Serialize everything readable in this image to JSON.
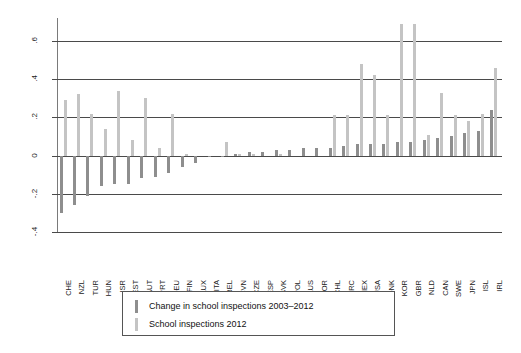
{
  "chart_data": {
    "type": "bar",
    "title": "",
    "subtitle": "",
    "xlabel": "",
    "ylabel": "",
    "ylim": [
      -0.4,
      0.72
    ],
    "yticks": [
      0.6,
      0.4,
      0.2,
      0,
      -0.2,
      -0.4
    ],
    "ytick_labels": [
      ".6",
      ".4",
      ".2",
      "0",
      "-.2",
      "-.4"
    ],
    "grid": true,
    "legend_position": "below-plot",
    "categories": [
      "CHE",
      "NZL",
      "TUR",
      "HUN",
      "ISR",
      "EST",
      "AUT",
      "PRT",
      "DEU",
      "FIN",
      "LUX",
      "ITA",
      "BEL",
      "SVN",
      "CZE",
      "ESP",
      "SVK",
      "POL",
      "AUS",
      "NOR",
      "CHL",
      "GRC",
      "MEX",
      "USA",
      "DNK",
      "KOR",
      "GBR",
      "NLD",
      "CAN",
      "SWE",
      "JPN",
      "ISL",
      "IRL"
    ],
    "series": [
      {
        "name": "Change in school inspections 2003–2012",
        "color": "#8e8e8e",
        "values": [
          -0.3,
          -0.26,
          -0.21,
          -0.16,
          -0.15,
          -0.15,
          -0.12,
          -0.11,
          -0.09,
          -0.06,
          -0.04,
          -0.01,
          0.0,
          0.01,
          0.02,
          0.02,
          0.03,
          0.03,
          0.04,
          0.04,
          0.04,
          0.05,
          0.06,
          0.06,
          0.06,
          0.07,
          0.07,
          0.08,
          0.09,
          0.1,
          0.12,
          0.13,
          0.24
        ]
      },
      {
        "name": "School inspections 2012",
        "color": "#c4c4c4",
        "values": [
          0.29,
          0.32,
          0.22,
          0.14,
          0.34,
          0.08,
          0.3,
          0.04,
          0.22,
          0.01,
          0.0,
          0.0,
          0.07,
          0.01,
          0.01,
          0.0,
          0.01,
          0.0,
          0.0,
          0.0,
          0.21,
          0.21,
          0.48,
          0.42,
          0.21,
          0.69,
          0.69,
          0.11,
          0.33,
          0.21,
          0.18,
          0.22,
          0.46
        ]
      }
    ]
  },
  "legend": {
    "items": [
      {
        "label": "Change in school inspections 2003–2012",
        "color": "#8e8e8e"
      },
      {
        "label": "School inspections 2012",
        "color": "#c4c4c4"
      }
    ]
  }
}
